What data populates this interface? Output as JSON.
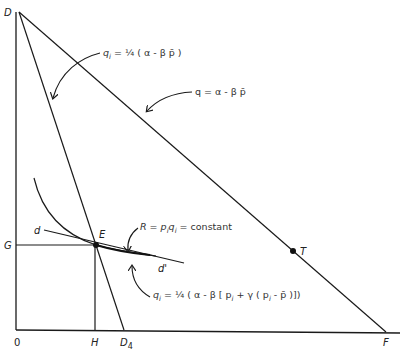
{
  "labels": {
    "D": "D",
    "G": "G",
    "O": "0",
    "H": "H",
    "D4": "D",
    "D4_sub": "4",
    "F": "F",
    "E": "E",
    "T": "T",
    "d": "d",
    "d_prime": "d'"
  },
  "equations": {
    "eq1": {
      "q": "q",
      "sub": "i",
      "rest": " = ¼ ( α - β p̄ )"
    },
    "eq2": {
      "text": "q = α - β p̄"
    },
    "eq3": {
      "R": "R = p",
      "sub1": "i",
      "q": "q",
      "sub2": "i",
      "rest": " = constant"
    },
    "eq4": {
      "q": "q",
      "sub": "i",
      "rest": " = ¼ ( α - β [ p",
      "sub2": "i",
      "rest2": " + γ ( p",
      "sub3": "i",
      "rest3": " - p̄ )])"
    }
  },
  "curves": {
    "demand_line_total": "q = α - βp̄",
    "reaction_line": "q_i = ¼(α - βp̄)",
    "iso_revenue": "R = p_i q_i = constant",
    "individual_demand": "d d'"
  }
}
